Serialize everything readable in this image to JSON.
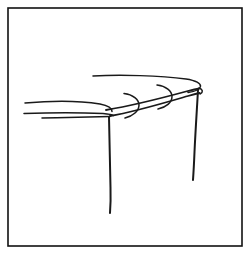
{
  "image": {
    "title": "Hand-drawn line sketch of a table in perspective",
    "description": "A monochrome pen sketch inside a thin rectangular border showing an elongated tabletop seen in perspective with two visible legs and two small C-shaped curve marks along the near edge.",
    "width": 249,
    "height": 260,
    "background_color": "#ffffff",
    "ink_color": "#1a1a1a",
    "frame_color": "#111111",
    "style": "pen line drawing"
  },
  "frame": {
    "name": "border-frame",
    "x": 8,
    "y": 8,
    "width": 234,
    "height": 238,
    "stroke_width": 1.6
  },
  "strokes": [
    {
      "name": "tabletop-far-edge",
      "label": "Far edge of tabletop curving right",
      "d": "M 93 76 C 120 74.5, 160 75.5, 186 79 C 196 80.5, 201 83.5, 200.5 86.5 C 200 89.5, 195 91.5, 188 92.5",
      "class": "ink-thin"
    },
    {
      "name": "tabletop-near-edge-upper",
      "label": "Upper near edge running from left rim to right corner",
      "d": "M 25 103 C 52 100.5, 82 101, 100 104 C 108 105.5, 112 108.5, 112 111.5",
      "class": "ink-thin"
    },
    {
      "name": "tabletop-left-rim-lower",
      "label": "Lower left rim line of tabletop",
      "d": "M 24 113.5 C 50 112.5, 82 112.5, 103 113.5 C 109 114, 112 114.5, 113.5 115.5",
      "class": "ink-thin"
    },
    {
      "name": "tabletop-left-rim-base",
      "label": "Short base line under left rim",
      "d": "M 42 118 C 66 117.5, 92 117, 110 116.5",
      "class": "ink-thin"
    },
    {
      "name": "tabletop-diagonal-upper",
      "label": "Upper diagonal edge rising to the right corner",
      "d": "M 106 110 C 130 106, 162 98, 186 91.5 C 192 90, 196 89, 199 88.5",
      "class": "ink-med"
    },
    {
      "name": "tabletop-diagonal-lower",
      "label": "Lower diagonal edge rising to the right corner",
      "d": "M 110 116 C 134 112, 164 103, 188 96 C 193 94.5, 197 93.5, 199.5 93",
      "class": "ink-med"
    },
    {
      "name": "right-corner-cap",
      "label": "Rounded cap joining edges at the right corner",
      "d": "M 199 88 C 203 89.5, 203.5 92, 200 94",
      "class": "ink-thin"
    },
    {
      "name": "curve-mark-left",
      "label": "C-shaped curve mark crossing the near edge (left)",
      "d": "M 124 93.5 C 133 94.5, 139 99.5, 139 105 C 139 111, 133 116, 125 118",
      "class": "ink-thin"
    },
    {
      "name": "curve-mark-right",
      "label": "C-shaped curve mark crossing the near edge (right)",
      "d": "M 157 85 C 166 86, 172 91, 172 96.5 C 172 102.5, 166 107.5, 158 109",
      "class": "ink-thin"
    },
    {
      "name": "table-leg-left",
      "label": "Front-left table leg descending to lower area",
      "d": "M 109 117 C 109.5 140, 110 165, 110.5 188 C 110.8 198, 110.5 206, 110 213",
      "class": "ink-leg"
    },
    {
      "name": "table-leg-right",
      "label": "Right table leg descending from the far corner",
      "d": "M 198 90 C 197 108, 195.5 130, 194.5 152 C 194 164, 193.5 173, 193 180",
      "class": "ink-leg"
    }
  ]
}
